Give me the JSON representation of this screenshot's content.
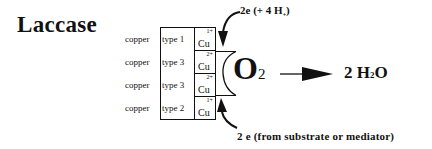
{
  "title": "Laccase",
  "copper_sites": [
    {
      "label_prefix": "copper",
      "label_type": "type 1",
      "symbol": "Cu",
      "oxidation": "1+"
    },
    {
      "label_prefix": "copper",
      "label_type": "type 3",
      "symbol": "Cu",
      "oxidation": "2+"
    },
    {
      "label_prefix": "copper",
      "label_type": "type 3",
      "symbol": "Cu",
      "oxidation": "2+"
    },
    {
      "label_prefix": "copper",
      "label_type": "type 2",
      "symbol": "Cu",
      "oxidation": "1+"
    }
  ],
  "substrate": {
    "main": "O",
    "subscript": "2"
  },
  "product": {
    "coefficient": "2",
    "h": "H",
    "h_sub": "2",
    "o": "O"
  },
  "top_input": {
    "text": "2e (+ 4 H",
    "sub": "+",
    "close": ")"
  },
  "bottom_input": {
    "text": "2 e (from substrate or mediator)"
  },
  "icons": {
    "reaction_arrow": "arrow-right-icon",
    "electron_arrow_top": "curved-arrow-down-icon",
    "electron_arrow_bottom": "curved-arrow-up-icon"
  },
  "colors": {
    "ink": "#111111",
    "background": "#ffffff"
  }
}
